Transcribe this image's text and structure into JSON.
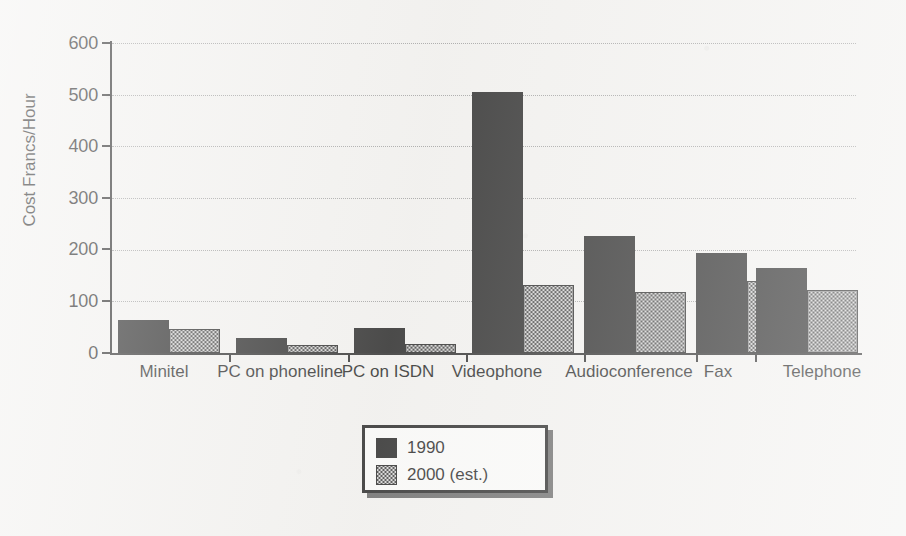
{
  "chart_data": {
    "type": "bar",
    "title": "",
    "xlabel": "",
    "ylabel": "Cost Francs/Hour",
    "ylim": [
      0,
      600
    ],
    "yticks": [
      0,
      100,
      200,
      300,
      400,
      500,
      600
    ],
    "ytick_labels": [
      "0",
      "100",
      "200",
      "300",
      "400",
      "500",
      "600"
    ],
    "grid": true,
    "grid_axis": "y",
    "grid_style": "dotted",
    "legend_position": "below-center",
    "categories": [
      "Minitel",
      "PC on phoneline",
      "PC on ISDN",
      "Videophone",
      "Audioconference",
      "Fax",
      "Telephone"
    ],
    "series": [
      {
        "name": "1990",
        "color": "#141414",
        "fill": "solid-black",
        "values": [
          64,
          29,
          48,
          505,
          226,
          194,
          165
        ]
      },
      {
        "name": "2000 (est.)",
        "color": "#b0b0b0",
        "fill": "checkerboard-gray",
        "values": [
          47,
          16,
          18,
          132,
          118,
          139,
          122
        ]
      }
    ]
  },
  "legend": {
    "entries": [
      {
        "label": "1990"
      },
      {
        "label": "2000 (est.)"
      }
    ]
  },
  "axes": {
    "y_title": "Cost Francs/Hour"
  }
}
